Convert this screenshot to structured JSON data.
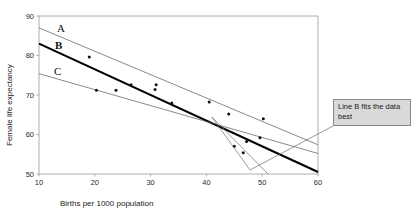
{
  "chart_data": {
    "type": "scatter",
    "title": "",
    "xlabel": "Births per 1000 population",
    "ylabel": "Female life expectancy",
    "xlim": [
      10,
      60
    ],
    "ylim": [
      50,
      90
    ],
    "xticks": [
      10,
      20,
      30,
      40,
      50,
      60
    ],
    "yticks": [
      50,
      60,
      70,
      80,
      90
    ],
    "xtick_labels": [
      "10",
      "20",
      "30",
      "40",
      "50",
      "60"
    ],
    "ytick_labels": [
      "50",
      "60",
      "70",
      "80",
      "90"
    ],
    "grid": false,
    "legend": "none",
    "points": [
      {
        "x": 19.0,
        "y": 79.6
      },
      {
        "x": 20.3,
        "y": 71.2
      },
      {
        "x": 23.8,
        "y": 71.2
      },
      {
        "x": 26.5,
        "y": 72.6
      },
      {
        "x": 30.8,
        "y": 71.4
      },
      {
        "x": 31.0,
        "y": 72.6
      },
      {
        "x": 33.8,
        "y": 68.0
      },
      {
        "x": 40.5,
        "y": 68.2
      },
      {
        "x": 44.0,
        "y": 65.2
      },
      {
        "x": 45.0,
        "y": 57.0
      },
      {
        "x": 46.6,
        "y": 55.4
      },
      {
        "x": 47.2,
        "y": 58.2
      },
      {
        "x": 49.6,
        "y": 59.2
      },
      {
        "x": 50.2,
        "y": 64.0
      }
    ],
    "series": [
      {
        "name": "A",
        "label": "A",
        "style": "thin",
        "color": "#555555",
        "x0": 10,
        "y0": 87.0,
        "x1": 60,
        "y1": 57.4
      },
      {
        "name": "B",
        "label": "B",
        "style": "thick",
        "color": "#000000",
        "x0": 10,
        "y0": 83.0,
        "x1": 60,
        "y1": 50.5
      },
      {
        "name": "C",
        "label": "C",
        "style": "thin",
        "color": "#555555",
        "x0": 10,
        "y0": 75.4,
        "x1": 60,
        "y1": 55.2
      }
    ],
    "annotations": [
      {
        "name": "callout",
        "text": "Line B fits the\ndata best",
        "target_x": 41.0,
        "target_y": 64.4
      }
    ]
  },
  "axes": {
    "x_title": "Births per 1000 population",
    "y_title": "Female life expectancy"
  },
  "labels": {
    "line_a": "A",
    "line_b": "B",
    "line_c": "C"
  },
  "annotation": {
    "text": "Line B fits the data best"
  },
  "colors": {
    "line_thick": "#000000",
    "line_thin": "#555555",
    "axis": "#9a9a9a",
    "point": "#111111",
    "callout_bg": "#d9d9d9",
    "callout_border": "#8a8a8a"
  }
}
